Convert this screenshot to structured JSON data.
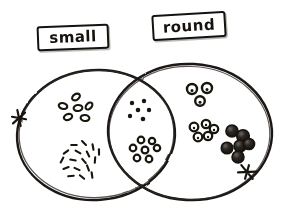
{
  "diagram": {
    "kind": "venn-diagram",
    "title": "",
    "style": "hand-drawn sketch, black ink on white paper",
    "ink_color": "#1a1713",
    "paper_color": "#ffffff",
    "sets": [
      {
        "id": "small",
        "label": "small",
        "label_position": "top-left",
        "circle": {
          "cx": 96,
          "cy": 135,
          "rx": 79,
          "ry": 65
        }
      },
      {
        "id": "round",
        "label": "round",
        "label_position": "top-right",
        "circle": {
          "cx": 190,
          "cy": 132,
          "rx": 82,
          "ry": 68
        }
      }
    ],
    "regions": [
      {
        "id": "small-only",
        "name": "small but not round",
        "clusters": [
          {
            "id": "small-only-rings",
            "item_style": "small-oval-ring",
            "count": 6,
            "points": [
              {
                "x": 76,
                "y": 97
              },
              {
                "x": 63,
                "y": 106
              },
              {
                "x": 78,
                "y": 108
              },
              {
                "x": 89,
                "y": 106
              },
              {
                "x": 68,
                "y": 117
              },
              {
                "x": 85,
                "y": 118
              }
            ]
          },
          {
            "id": "small-only-slivers",
            "item_style": "tiny-dash",
            "count": 17,
            "points": [
              {
                "x": 74,
                "y": 145,
                "a": -20
              },
              {
                "x": 84,
                "y": 143,
                "a": 25
              },
              {
                "x": 93,
                "y": 147,
                "a": 60
              },
              {
                "x": 66,
                "y": 152,
                "a": -55
              },
              {
                "x": 78,
                "y": 152,
                "a": 10
              },
              {
                "x": 88,
                "y": 154,
                "a": 45
              },
              {
                "x": 99,
                "y": 152,
                "a": 70
              },
              {
                "x": 62,
                "y": 160,
                "a": -80
              },
              {
                "x": 73,
                "y": 160,
                "a": -10
              },
              {
                "x": 84,
                "y": 161,
                "a": 30
              },
              {
                "x": 95,
                "y": 160,
                "a": 75
              },
              {
                "x": 66,
                "y": 168,
                "a": -40
              },
              {
                "x": 77,
                "y": 169,
                "a": 5
              },
              {
                "x": 88,
                "y": 168,
                "a": 50
              },
              {
                "x": 71,
                "y": 176,
                "a": -25
              },
              {
                "x": 82,
                "y": 177,
                "a": 20
              },
              {
                "x": 92,
                "y": 175,
                "a": 62
              }
            ]
          }
        ]
      },
      {
        "id": "intersection",
        "name": "small and round",
        "clusters": [
          {
            "id": "intersection-dots",
            "item_style": "tiny-dot",
            "count": 6,
            "points": [
              {
                "x": 132,
                "y": 103
              },
              {
                "x": 144,
                "y": 101
              },
              {
                "x": 138,
                "y": 110
              },
              {
                "x": 149,
                "y": 110
              },
              {
                "x": 130,
                "y": 116
              },
              {
                "x": 143,
                "y": 119
              }
            ]
          },
          {
            "id": "intersection-rings",
            "item_style": "small-ring",
            "count": 7,
            "points": [
              {
                "x": 141,
                "y": 140
              },
              {
                "x": 152,
                "y": 141
              },
              {
                "x": 133,
                "y": 148
              },
              {
                "x": 145,
                "y": 150
              },
              {
                "x": 157,
                "y": 148
              },
              {
                "x": 137,
                "y": 158
              },
              {
                "x": 149,
                "y": 159
              }
            ]
          }
        ]
      },
      {
        "id": "round-only",
        "name": "round but not small",
        "clusters": [
          {
            "id": "round-only-top-rings",
            "item_style": "medium-ring",
            "count": 3,
            "points": [
              {
                "x": 192,
                "y": 89
              },
              {
                "x": 207,
                "y": 88
              },
              {
                "x": 200,
                "y": 101
              }
            ]
          },
          {
            "id": "round-only-mid-rings",
            "item_style": "medium-ring",
            "count": 5,
            "points": [
              {
                "x": 194,
                "y": 127
              },
              {
                "x": 206,
                "y": 124
              },
              {
                "x": 214,
                "y": 129
              },
              {
                "x": 198,
                "y": 137
              },
              {
                "x": 208,
                "y": 136
              }
            ]
          },
          {
            "id": "round-only-dark-balls",
            "item_style": "large-filled-ball",
            "count": 6,
            "points": [
              {
                "x": 232,
                "y": 131
              },
              {
                "x": 243,
                "y": 136
              },
              {
                "x": 240,
                "y": 146
              },
              {
                "x": 248,
                "y": 143
              },
              {
                "x": 227,
                "y": 148
              },
              {
                "x": 238,
                "y": 156
              }
            ]
          }
        ]
      }
    ],
    "marks": [
      {
        "id": "knot-left",
        "name": "knot-tie-mark-left",
        "x": 19,
        "y": 118,
        "a": -72
      },
      {
        "id": "knot-right",
        "name": "knot-tie-mark-right",
        "x": 247,
        "y": 172,
        "a": 24
      }
    ],
    "crossings": [
      {
        "id": "crossing-top",
        "x": 140,
        "y": 70
      },
      {
        "id": "crossing-bottom",
        "x": 145,
        "y": 196
      }
    ]
  }
}
